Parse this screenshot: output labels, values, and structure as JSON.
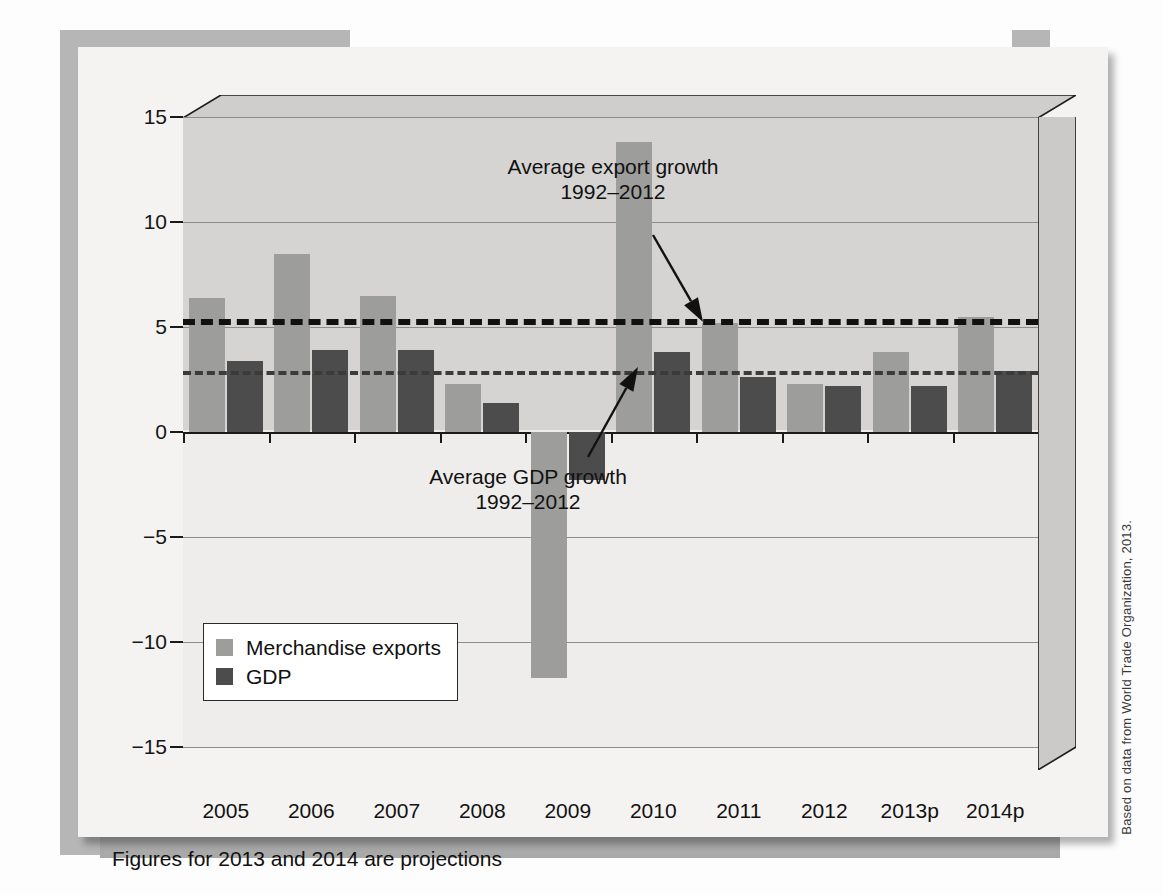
{
  "figure": {
    "footnote": "Figures for 2013 and 2014 are projections",
    "source_credit": "Based on data from World Trade Organization, 2013."
  },
  "colors": {
    "exports": "#9d9d9b",
    "gdp": "#4c4c4c",
    "avg_exports_line": "#111111",
    "avg_gdp_line": "#3b3b3b",
    "plot_background": "#d5d4d2",
    "card_background": "#f4f3f1"
  },
  "legend": {
    "position": "inside-bottom-left",
    "items": [
      {
        "label": "Merchandise exports",
        "color": "#9d9d9b"
      },
      {
        "label": "GDP",
        "color": "#4c4c4c"
      }
    ]
  },
  "annotations": [
    {
      "id": "avg-export-growth",
      "line1": "Average export growth",
      "line2": "1992–2012",
      "value": 5.4
    },
    {
      "id": "avg-gdp-growth",
      "line1": "Average GDP growth",
      "line2": "1992–2012",
      "value": 2.9
    }
  ],
  "chart_data": {
    "type": "bar",
    "title": "",
    "subtitle": "",
    "xlabel": "",
    "ylabel": "",
    "ylim": [
      -15,
      15
    ],
    "yticks": [
      15,
      10,
      5,
      0,
      -5,
      -10,
      -15
    ],
    "ytick_labels": [
      "15",
      "10",
      "5",
      "0",
      "−5",
      "−10",
      "−15"
    ],
    "grid": true,
    "legend_position": "inside-bottom-left",
    "categories": [
      "2005",
      "2006",
      "2007",
      "2008",
      "2009",
      "2010",
      "2011",
      "2012",
      "2013p",
      "2014p"
    ],
    "series": [
      {
        "name": "Merchandise exports",
        "color": "#9d9d9b",
        "values": [
          6.4,
          8.5,
          6.5,
          2.3,
          -11.7,
          13.8,
          5.2,
          2.3,
          3.8,
          5.5
        ]
      },
      {
        "name": "GDP",
        "color": "#4c4c4c",
        "values": [
          3.4,
          3.9,
          3.9,
          1.4,
          -2.3,
          3.8,
          2.6,
          2.2,
          2.2,
          2.9
        ]
      }
    ],
    "reference_lines": [
      {
        "label": "Average export growth 1992–2012",
        "value": 5.4,
        "style": "dashed",
        "color": "#111111"
      },
      {
        "label": "Average GDP growth 1992–2012",
        "value": 2.9,
        "style": "dashed",
        "color": "#3b3b3b"
      }
    ]
  }
}
